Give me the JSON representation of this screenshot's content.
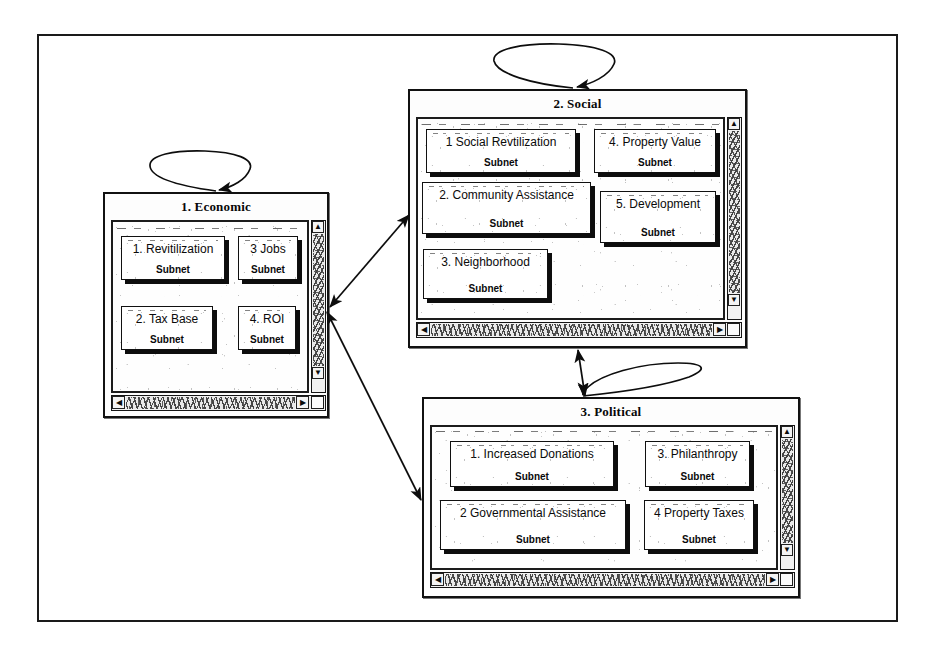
{
  "diagram": {
    "frame": {
      "stroke": "#1a1a1a"
    }
  },
  "clusters": [
    {
      "id": "economic",
      "title": "1. Economic",
      "subnet_label": "Subnet",
      "nodes": [
        {
          "id": "econ-1",
          "label": "1. Revitilization",
          "subnet": "Subnet"
        },
        {
          "id": "econ-3",
          "label": "3  Jobs",
          "subnet": "Subnet"
        },
        {
          "id": "econ-2",
          "label": "2. Tax Base",
          "subnet": "Subnet"
        },
        {
          "id": "econ-4",
          "label": "4. ROI",
          "subnet": "Subnet"
        }
      ],
      "scrollbars": {
        "vertical": {
          "up": "▲",
          "down": "▼"
        },
        "horizontal": {
          "left": "◀",
          "right": "▶"
        }
      }
    },
    {
      "id": "social",
      "title": "2. Social",
      "subnet_label": "Subnet",
      "nodes": [
        {
          "id": "soc-1",
          "label": "1  Social Revtilization",
          "subnet": "Subnet"
        },
        {
          "id": "soc-4",
          "label": "4. Property Value",
          "subnet": "Subnet"
        },
        {
          "id": "soc-2",
          "label": "2. Community Assistance",
          "subnet": "Subnet"
        },
        {
          "id": "soc-5",
          "label": "5. Development",
          "subnet": "Subnet"
        },
        {
          "id": "soc-3",
          "label": "3. Neighborhood",
          "subnet": "Subnet"
        }
      ],
      "scrollbars": {
        "vertical": {
          "up": "▲",
          "down": "▼"
        },
        "horizontal": {
          "left": "◀",
          "right": "▶"
        }
      }
    },
    {
      "id": "political",
      "title": "3. Political",
      "subnet_label": "Subnet",
      "nodes": [
        {
          "id": "pol-1",
          "label": "1. Increased Donations",
          "subnet": "Subnet"
        },
        {
          "id": "pol-3",
          "label": "3. Philanthropy",
          "subnet": "Subnet"
        },
        {
          "id": "pol-2",
          "label": "2  Governmental Assistance",
          "subnet": "Subnet"
        },
        {
          "id": "pol-4",
          "label": "4  Property Taxes",
          "subnet": "Subnet"
        }
      ],
      "scrollbars": {
        "vertical": {
          "up": "▲",
          "down": "▼"
        },
        "horizontal": {
          "left": "◀",
          "right": "▶"
        }
      }
    }
  ],
  "connections": [
    {
      "id": "loop-economic",
      "from": "economic",
      "to": "economic",
      "kind": "self-loop"
    },
    {
      "id": "loop-social",
      "from": "social",
      "to": "social",
      "kind": "self-loop"
    },
    {
      "id": "loop-political",
      "from": "political",
      "to": "political",
      "kind": "self-loop"
    },
    {
      "id": "econ-social",
      "from": "economic",
      "to": "social",
      "kind": "bidirectional"
    },
    {
      "id": "econ-political",
      "from": "economic",
      "to": "political",
      "kind": "bidirectional"
    },
    {
      "id": "social-political",
      "from": "social",
      "to": "political",
      "kind": "bidirectional"
    }
  ]
}
